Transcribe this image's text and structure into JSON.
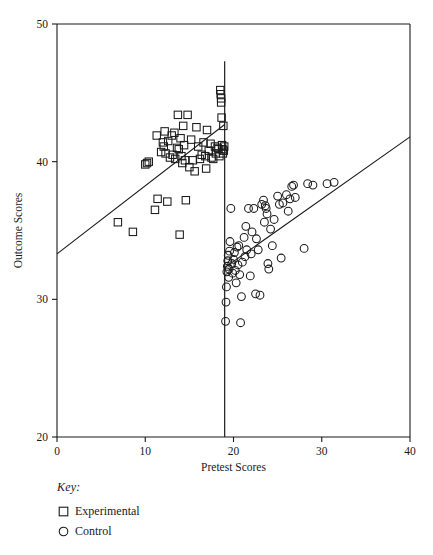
{
  "chart_data": {
    "type": "scatter",
    "title": "",
    "xlabel": "Pretest Scores",
    "ylabel": "Outcome Scores",
    "xlim": [
      0,
      40
    ],
    "ylim": [
      20,
      50
    ],
    "xticks": [
      0,
      10,
      20,
      30,
      40
    ],
    "yticks": [
      20,
      30,
      40,
      50
    ],
    "xtick_labels": [
      "0",
      "10",
      "20",
      "30",
      "40"
    ],
    "ytick_labels": [
      "20",
      "30",
      "40",
      "50"
    ],
    "grid": false,
    "legend_position": "below-left",
    "annotations": {
      "cutoff_x": 19,
      "cutoff_label": "cutoff line"
    },
    "series": [
      {
        "name": "Experimental",
        "marker": "square",
        "points": [
          [
            6.9,
            35.6
          ],
          [
            8.6,
            34.9
          ],
          [
            10.0,
            39.8
          ],
          [
            10.2,
            39.9
          ],
          [
            10.4,
            40.0
          ],
          [
            11.1,
            36.5
          ],
          [
            11.3,
            41.9
          ],
          [
            11.4,
            37.3
          ],
          [
            11.8,
            40.7
          ],
          [
            12.0,
            41.4
          ],
          [
            12.1,
            41.1
          ],
          [
            12.2,
            42.2
          ],
          [
            12.3,
            40.6
          ],
          [
            12.5,
            37.1
          ],
          [
            12.6,
            41.5
          ],
          [
            12.8,
            40.3
          ],
          [
            13.0,
            41.9
          ],
          [
            13.1,
            40.5
          ],
          [
            13.3,
            42.1
          ],
          [
            13.4,
            40.2
          ],
          [
            13.6,
            41.0
          ],
          [
            13.7,
            43.4
          ],
          [
            13.8,
            40.9
          ],
          [
            13.9,
            34.7
          ],
          [
            14.0,
            41.7
          ],
          [
            14.1,
            40.4
          ],
          [
            14.2,
            39.9
          ],
          [
            14.3,
            42.6
          ],
          [
            14.4,
            41.2
          ],
          [
            14.5,
            40.1
          ],
          [
            14.6,
            37.2
          ],
          [
            14.8,
            43.4
          ],
          [
            15.0,
            39.6
          ],
          [
            15.2,
            41.6
          ],
          [
            15.4,
            40.1
          ],
          [
            15.6,
            39.3
          ],
          [
            15.8,
            42.5
          ],
          [
            16.0,
            41.1
          ],
          [
            16.2,
            40.2
          ],
          [
            16.4,
            40.5
          ],
          [
            16.6,
            41.4
          ],
          [
            16.8,
            40.4
          ],
          [
            16.9,
            39.5
          ],
          [
            17.0,
            42.3
          ],
          [
            17.2,
            40.8
          ],
          [
            17.4,
            41.3
          ],
          [
            17.5,
            40.3
          ],
          [
            17.7,
            40.2
          ],
          [
            17.9,
            41.1
          ],
          [
            18.0,
            40.6
          ],
          [
            18.2,
            41.0
          ],
          [
            18.3,
            40.9
          ],
          [
            18.4,
            40.4
          ],
          [
            18.5,
            45.2
          ],
          [
            18.55,
            44.9
          ],
          [
            18.6,
            44.6
          ],
          [
            18.6,
            44.3
          ],
          [
            18.65,
            43.2
          ],
          [
            18.7,
            41.2
          ],
          [
            18.75,
            40.9
          ],
          [
            18.8,
            40.6
          ],
          [
            18.85,
            42.6
          ],
          [
            18.9,
            40.8
          ],
          [
            18.95,
            41.1
          ]
        ]
      },
      {
        "name": "Control",
        "marker": "circle",
        "points": [
          [
            19.1,
            28.4
          ],
          [
            19.15,
            29.8
          ],
          [
            19.2,
            30.9
          ],
          [
            19.25,
            32.0
          ],
          [
            19.3,
            32.4
          ],
          [
            19.35,
            32.8
          ],
          [
            19.4,
            33.2
          ],
          [
            19.45,
            31.6
          ],
          [
            19.5,
            32.2
          ],
          [
            19.55,
            33.5
          ],
          [
            19.6,
            34.2
          ],
          [
            19.7,
            36.6
          ],
          [
            19.8,
            32.6
          ],
          [
            19.9,
            31.9
          ],
          [
            20.0,
            32.9
          ],
          [
            20.1,
            33.4
          ],
          [
            20.2,
            32.1
          ],
          [
            20.3,
            31.2
          ],
          [
            20.4,
            33.8
          ],
          [
            20.5,
            32.5
          ],
          [
            20.6,
            33.9
          ],
          [
            20.7,
            31.8
          ],
          [
            20.8,
            28.3
          ],
          [
            20.9,
            30.2
          ],
          [
            21.0,
            32.7
          ],
          [
            21.2,
            34.5
          ],
          [
            21.3,
            33.1
          ],
          [
            21.4,
            35.3
          ],
          [
            21.5,
            33.6
          ],
          [
            21.7,
            36.6
          ],
          [
            21.9,
            31.7
          ],
          [
            22.0,
            33.3
          ],
          [
            22.1,
            34.9
          ],
          [
            22.3,
            36.6
          ],
          [
            22.5,
            30.4
          ],
          [
            22.6,
            34.4
          ],
          [
            22.8,
            33.6
          ],
          [
            23.0,
            30.3
          ],
          [
            23.2,
            36.9
          ],
          [
            23.4,
            37.2
          ],
          [
            23.5,
            35.6
          ],
          [
            23.6,
            36.8
          ],
          [
            23.7,
            36.6
          ],
          [
            23.8,
            36.2
          ],
          [
            23.9,
            32.6
          ],
          [
            24.0,
            32.2
          ],
          [
            24.2,
            35.1
          ],
          [
            24.4,
            33.9
          ],
          [
            24.6,
            35.8
          ],
          [
            25.0,
            37.5
          ],
          [
            25.2,
            36.9
          ],
          [
            25.4,
            33.0
          ],
          [
            25.6,
            37.0
          ],
          [
            26.0,
            37.6
          ],
          [
            26.2,
            36.4
          ],
          [
            26.4,
            37.3
          ],
          [
            26.6,
            38.2
          ],
          [
            26.8,
            38.3
          ],
          [
            27.0,
            37.4
          ],
          [
            28.0,
            33.7
          ],
          [
            28.4,
            38.4
          ],
          [
            29.0,
            38.3
          ],
          [
            30.6,
            38.4
          ],
          [
            31.4,
            38.5
          ]
        ]
      }
    ],
    "fit_lines": [
      {
        "name": "experimental-fit",
        "x0": 0,
        "y0": 33.3,
        "x1": 19,
        "y1": 42.7
      },
      {
        "name": "control-fit",
        "x0": 19,
        "y1": 41.8,
        "y0": 32.3,
        "x1": 40
      }
    ]
  },
  "legend": {
    "heading": "Key:",
    "items": [
      {
        "glyph": "square-marker-icon",
        "label": "Experimental"
      },
      {
        "glyph": "circle-marker-icon",
        "label": "Control"
      }
    ]
  },
  "colors": {
    "ink": "#1a1a1a",
    "background": "#ffffff"
  }
}
